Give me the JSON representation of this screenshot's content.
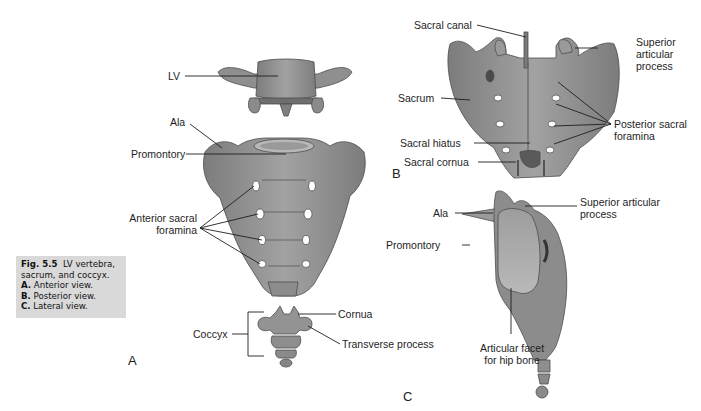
{
  "figure": {
    "caption": {
      "number": "Fig. 5.5",
      "title": "LV vertebra, sacrum, and coccyx.",
      "title_line1": "LV vertebra,",
      "title_line2": "sacrum, and coccyx.",
      "items": [
        {
          "key": "A.",
          "text": "Anterior view."
        },
        {
          "key": "B.",
          "text": "Posterior view."
        },
        {
          "key": "C.",
          "text": "Lateral view."
        }
      ]
    },
    "panels": {
      "A": {
        "letter": "A",
        "view": "Anterior view",
        "labels": {
          "lv": "LV",
          "ala": "Ala",
          "promontory": "Promontory",
          "anterior_foramina_1": "Anterior sacral",
          "anterior_foramina_2": "foramina",
          "coccyx": "Coccyx",
          "cornua": "Cornua",
          "transverse_process": "Transverse process"
        }
      },
      "B": {
        "letter": "B",
        "view": "Posterior view",
        "labels": {
          "sacral_canal": "Sacral canal",
          "superior_articular_1": "Superior",
          "superior_articular_2": "articular",
          "superior_articular_3": "process",
          "sacrum": "Sacrum",
          "posterior_foramina_1": "Posterior sacral",
          "posterior_foramina_2": "foramina",
          "sacral_hiatus": "Sacral hiatus",
          "sacral_cornua": "Sacral cornua"
        }
      },
      "C": {
        "letter": "C",
        "view": "Lateral view",
        "labels": {
          "ala": "Ala",
          "superior_articular_1": "Superior articular",
          "superior_articular_2": "process",
          "promontory": "Promontory",
          "facet_1": "Articular facet",
          "facet_2": "for hip bone"
        }
      }
    },
    "colors": {
      "bone_fill": "#8e8e8e",
      "bone_light": "#b4b4b4",
      "bone_dark": "#5e5e5e",
      "leader_line": "#1e1e1e",
      "caption_bg": "#d9d9d9"
    }
  }
}
